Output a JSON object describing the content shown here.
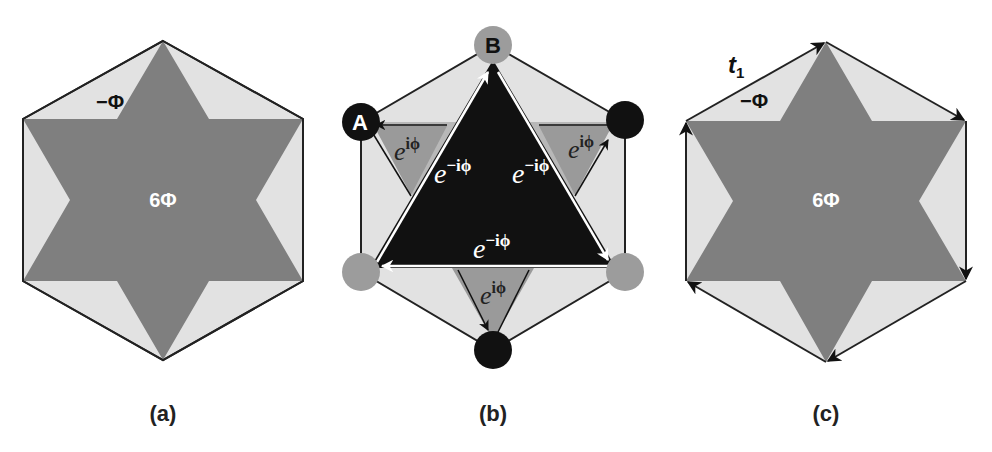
{
  "colors": {
    "hexagon_fill": "#e2e2e2",
    "star_fill": "#7f7f7f",
    "gray_triangle": "#9a9a9a",
    "gray_band": "#b8b8b8",
    "black": "#111111",
    "gray_site": "#9c9c9c",
    "white": "#ffffff"
  },
  "panels": [
    {
      "id": "a",
      "caption": "(a)",
      "labels": {
        "corner_flux": "−Φ",
        "center_flux": "6Φ"
      }
    },
    {
      "id": "b",
      "caption": "(b)",
      "sites": {
        "site_a": "A",
        "site_b": "B"
      },
      "hopping": {
        "inner": [
          "e",
          "e",
          "e"
        ],
        "inner_exp": [
          "−iϕ",
          "−iϕ",
          "−iϕ"
        ],
        "outer": [
          "e",
          "e",
          "e"
        ],
        "outer_exp": [
          "iϕ",
          "iϕ",
          "iϕ"
        ]
      }
    },
    {
      "id": "c",
      "caption": "(c)",
      "labels": {
        "hopping": "t",
        "hopping_sub": "1",
        "corner_flux": "−Φ",
        "center_flux": "6Φ"
      }
    }
  ]
}
